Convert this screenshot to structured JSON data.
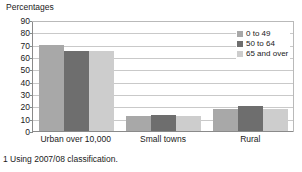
{
  "chart_data": {
    "type": "bar",
    "title": "Percentages",
    "ylabel": "Percentages",
    "xlabel": "",
    "categories": [
      "Urban over 10,000",
      "Small towns",
      "Rural"
    ],
    "series": [
      {
        "name": "0 to 49",
        "values": [
          70,
          12,
          18
        ],
        "color": "#a8a8a8"
      },
      {
        "name": "50 to 64",
        "values": [
          65,
          13,
          20
        ],
        "color": "#6e6e6e"
      },
      {
        "name": "65 and over",
        "values": [
          65,
          12,
          18
        ],
        "color": "#cdcdcd"
      }
    ],
    "ylim": [
      0,
      90
    ],
    "ytick_step": 10,
    "yticks": [
      0,
      10,
      20,
      30,
      40,
      50,
      60,
      70,
      80,
      90
    ],
    "grid": true,
    "grid_axis": "y",
    "legend_position": "top-right"
  },
  "legend": {
    "entries": [
      {
        "label": "0 to 49",
        "swatch": "#a8a8a8"
      },
      {
        "label": "50 to 64",
        "swatch": "#6e6e6e"
      },
      {
        "label": "65 and over",
        "swatch": "#cdcdcd"
      }
    ]
  },
  "footnote": {
    "text": "1 Using 2007/08 classification."
  },
  "colors": {
    "axis": "#8a8a8a",
    "grid": "#c9c9c9",
    "text": "#1a1a1a",
    "background": "#ffffff"
  }
}
